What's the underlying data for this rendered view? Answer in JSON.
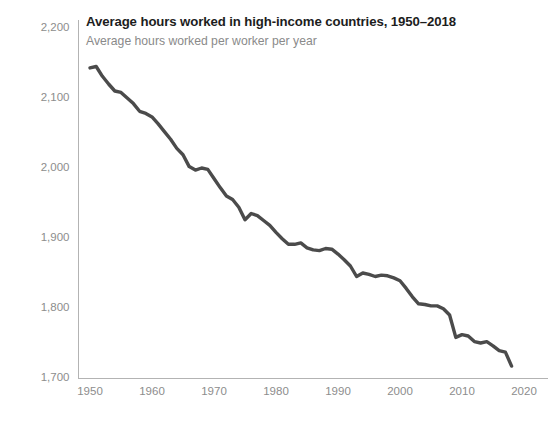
{
  "header": {
    "title": "Average hours worked in high-income countries, 1950–2018",
    "subtitle": "Average hours worked per worker per year"
  },
  "colors": {
    "line": "#4b4b4b",
    "axis": "#b3b3b3",
    "tick_text": "#8d8d8d",
    "title_text": "#1d1d1d",
    "subtitle_text": "#8a8a8a",
    "background": "#ffffff"
  },
  "chart_data": {
    "type": "line",
    "title": "Average hours worked in high-income countries, 1950–2018",
    "subtitle": "Average hours worked per worker per year",
    "xlabel": "",
    "ylabel": "",
    "xlim": [
      1948,
      2022
    ],
    "ylim": [
      1700,
      2200
    ],
    "grid": false,
    "legend": null,
    "xticks": [
      1950,
      1960,
      1970,
      1980,
      1990,
      2000,
      2010,
      2020
    ],
    "xtick_labels": [
      "1950",
      "1960",
      "1970",
      "1980",
      "1990",
      "2000",
      "2010",
      "2020"
    ],
    "yticks": [
      1700,
      1800,
      1900,
      2000,
      2100,
      2200
    ],
    "ytick_labels": [
      "1,700",
      "1,800",
      "1,900",
      "2,000",
      "2,100",
      "2,200"
    ],
    "series": [
      {
        "name": "Average annual hours worked per worker",
        "x": [
          1950,
          1951,
          1952,
          1953,
          1954,
          1955,
          1956,
          1957,
          1958,
          1959,
          1960,
          1961,
          1962,
          1963,
          1964,
          1965,
          1966,
          1967,
          1968,
          1969,
          1970,
          1971,
          1972,
          1973,
          1974,
          1975,
          1976,
          1977,
          1978,
          1979,
          1980,
          1981,
          1982,
          1983,
          1984,
          1985,
          1986,
          1987,
          1988,
          1989,
          1990,
          1991,
          1992,
          1993,
          1994,
          1995,
          1996,
          1997,
          1998,
          1999,
          2000,
          2001,
          2002,
          2003,
          2004,
          2005,
          2006,
          2007,
          2008,
          2009,
          2010,
          2011,
          2012,
          2013,
          2014,
          2015,
          2016,
          2017,
          2018
        ],
        "values": [
          2143,
          2145,
          2131,
          2120,
          2110,
          2108,
          2100,
          2092,
          2081,
          2078,
          2073,
          2063,
          2052,
          2041,
          2028,
          2019,
          2002,
          1997,
          2000,
          1998,
          1985,
          1972,
          1960,
          1955,
          1944,
          1926,
          1935,
          1932,
          1925,
          1918,
          1908,
          1899,
          1891,
          1891,
          1893,
          1886,
          1883,
          1882,
          1885,
          1884,
          1877,
          1869,
          1860,
          1845,
          1850,
          1848,
          1845,
          1847,
          1846,
          1843,
          1839,
          1828,
          1816,
          1806,
          1805,
          1803,
          1803,
          1799,
          1790,
          1758,
          1762,
          1760,
          1752,
          1750,
          1752,
          1746,
          1739,
          1737,
          1717
        ]
      }
    ]
  }
}
